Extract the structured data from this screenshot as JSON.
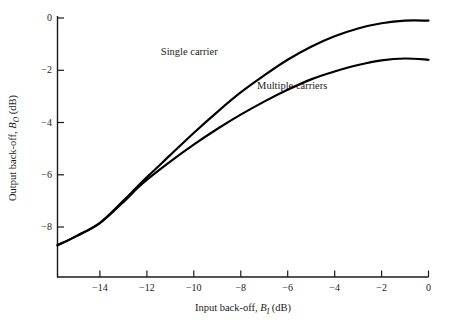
{
  "chart_data": {
    "type": "line",
    "title": "",
    "xlabel": "Input back-off, B_I (dB)",
    "ylabel": "Output back-off, B_O (dB)",
    "xlabel_parts": {
      "prefix": "Input back-off, ",
      "symbol": "B",
      "subscript": "I",
      "suffix": " (dB)"
    },
    "ylabel_parts": {
      "prefix": "Output back-off, ",
      "symbol": "B",
      "subscript": "O",
      "suffix": " (dB)"
    },
    "xlim": [
      -15.8,
      0
    ],
    "ylim": [
      -9.9,
      0
    ],
    "grid": false,
    "legend_position": "inline-annotations",
    "xticks": [
      -14,
      -12,
      -10,
      -8,
      -6,
      -4,
      -2,
      0
    ],
    "xtick_labels": [
      "−14",
      "−12",
      "−10",
      "−8",
      "−6",
      "−4",
      "−2",
      "0"
    ],
    "yticks": [
      0,
      -2,
      -4,
      -6,
      -8
    ],
    "ytick_labels": [
      "0",
      "−2",
      "−4",
      "−6",
      "−8"
    ],
    "series": [
      {
        "name": "Single carrier",
        "color": "#000000",
        "x": [
          -15.8,
          -15.0,
          -14.0,
          -13.0,
          -12.5,
          -12.0,
          -11.0,
          -10.0,
          -9.0,
          -8.0,
          -7.0,
          -6.0,
          -5.0,
          -4.0,
          -3.0,
          -2.0,
          -1.0,
          0.0
        ],
        "y": [
          -8.7,
          -8.35,
          -7.85,
          -7.0,
          -6.55,
          -6.1,
          -5.25,
          -4.4,
          -3.6,
          -2.85,
          -2.2,
          -1.6,
          -1.1,
          -0.7,
          -0.4,
          -0.2,
          -0.1,
          -0.1
        ]
      },
      {
        "name": "Multiple carriers",
        "color": "#000000",
        "x": [
          -15.8,
          -15.0,
          -14.0,
          -13.0,
          -12.5,
          -12.0,
          -11.0,
          -10.0,
          -9.0,
          -8.0,
          -7.0,
          -6.0,
          -5.0,
          -4.0,
          -3.0,
          -2.0,
          -1.0,
          0.0
        ],
        "y": [
          -8.7,
          -8.35,
          -7.85,
          -7.05,
          -6.6,
          -6.2,
          -5.5,
          -4.85,
          -4.25,
          -3.7,
          -3.2,
          -2.75,
          -2.35,
          -2.05,
          -1.8,
          -1.62,
          -1.55,
          -1.6
        ]
      }
    ],
    "annotations": [
      {
        "text": "Single carrier",
        "x": -11.4,
        "y": -1.1
      },
      {
        "text": "Multiple carriers",
        "x": -7.3,
        "y": -2.4
      }
    ]
  }
}
